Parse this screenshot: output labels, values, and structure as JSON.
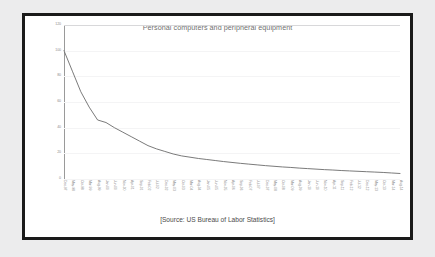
{
  "chart_data": {
    "type": "line",
    "title": "Personal computers and peripheral equipment",
    "xlabel": "",
    "ylabel": "",
    "ylim": [
      0,
      120
    ],
    "yticks": [
      0,
      20,
      40,
      60,
      80,
      100,
      120
    ],
    "grid": true,
    "legend": "none",
    "line_color": "#6b6b6b",
    "source_note": "[Source: US Bureau of Labor Statistics]",
    "categories": [
      "Dec-97",
      "May-98",
      "Oct-98",
      "Mar-99",
      "Aug-99",
      "Jan-00",
      "Jun-00",
      "Nov-00",
      "Apr-01",
      "Sep-01",
      "Feb-02",
      "Jul-02",
      "Dec-02",
      "May-03",
      "Oct-03",
      "Mar-04",
      "Aug-04",
      "Jan-05",
      "Jun-05",
      "Nov-05",
      "Apr-06",
      "Sep-06",
      "Feb-07",
      "Jul-07",
      "Dec-07",
      "May-08",
      "Oct-08",
      "Mar-09",
      "Aug-09",
      "Jan-10",
      "Jun-10",
      "Nov-10",
      "Apr-11",
      "Sep-11",
      "Feb-12",
      "Jul-12",
      "Dec-12",
      "May-13",
      "Oct-13",
      "Mar-14",
      "Aug-14"
    ],
    "values": [
      100.0,
      84.0,
      68.0,
      56.0,
      46.0,
      44.0,
      40.0,
      36.5,
      33.0,
      29.5,
      26.0,
      23.5,
      21.5,
      19.5,
      18.0,
      17.0,
      16.0,
      15.2,
      14.4,
      13.6,
      12.9,
      12.2,
      11.6,
      11.0,
      10.4,
      9.9,
      9.4,
      9.0,
      8.5,
      8.1,
      7.7,
      7.3,
      7.0,
      6.6,
      6.3,
      6.0,
      5.7,
      5.4,
      5.1,
      4.7,
      4.3
    ]
  },
  "figure": {
    "background_color": "#ececed",
    "card_color": "#ffffff",
    "border_color": "#1a1a1a"
  }
}
